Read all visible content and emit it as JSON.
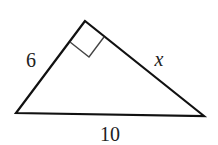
{
  "diagram": {
    "type": "right-triangle",
    "vertices": {
      "apex": [
        85,
        21
      ],
      "left": [
        16,
        113
      ],
      "right": [
        204,
        116
      ]
    },
    "right_angle_at": "apex",
    "labels": {
      "left_leg": "6",
      "right_leg": "x",
      "hypotenuse": "10"
    },
    "colors": {
      "stroke": "#111111",
      "marker": "#444444",
      "text": "#222222"
    }
  }
}
